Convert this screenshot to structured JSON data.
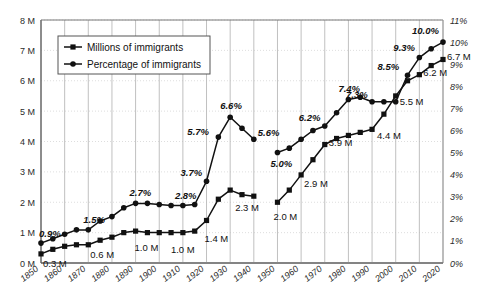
{
  "chart_data": {
    "type": "line",
    "title": "",
    "xlabel": "",
    "ylabel": "",
    "legend_position": "top-left",
    "grid": true,
    "x": [
      1850,
      1855,
      1860,
      1865,
      1870,
      1875,
      1880,
      1885,
      1890,
      1895,
      1900,
      1905,
      1910,
      1915,
      1920,
      1925,
      1930,
      1935,
      1940,
      1945,
      1950,
      1955,
      1960,
      1965,
      1970,
      1975,
      1980,
      1985,
      1990,
      1995,
      2000,
      2005,
      2010,
      2015,
      2020
    ],
    "xticks": [
      "1850",
      "1860",
      "1870",
      "1880",
      "1890",
      "1900",
      "1910",
      "1920",
      "1930",
      "1940",
      "1950",
      "1960",
      "1970",
      "1980",
      "1990",
      "2000",
      "2010",
      "2020"
    ],
    "xlim": [
      1850,
      2020
    ],
    "left_axis": {
      "label": "Millions of immigrants",
      "ticks": [
        "0 M",
        "1 M",
        "2 M",
        "3 M",
        "4 M",
        "5 M",
        "6 M",
        "7 M",
        "8 M"
      ],
      "ylim": [
        0,
        8
      ],
      "unit": "M"
    },
    "right_axis": {
      "label": "Percentage of immigrants",
      "ticks": [
        "0%",
        "1%",
        "2%",
        "3%",
        "4%",
        "5%",
        "6%",
        "7%",
        "8%",
        "9%",
        "10%",
        "11%"
      ],
      "ylim": [
        0,
        11
      ],
      "unit": "%"
    },
    "series": [
      {
        "name": "Millions of immigrants",
        "axis": "left",
        "marker": "square",
        "color": "#111111",
        "values": [
          0.3,
          0.45,
          0.55,
          0.6,
          0.6,
          0.75,
          0.85,
          1.0,
          1.05,
          1.0,
          1.0,
          1.0,
          1.0,
          1.05,
          1.4,
          2.1,
          2.4,
          2.25,
          2.2,
          null,
          2.0,
          2.4,
          2.9,
          3.4,
          3.9,
          4.1,
          4.2,
          4.3,
          4.4,
          4.9,
          5.5,
          6.0,
          6.2,
          6.5,
          6.7
        ],
        "labeled_points": [
          {
            "x": 1850,
            "value": "0.3 M"
          },
          {
            "x": 1870,
            "value": "0.6 M"
          },
          {
            "x": 1890,
            "value": "1.0 M"
          },
          {
            "x": 1910,
            "value": "1.0 M"
          },
          {
            "x": 1920,
            "value": "1.4 M"
          },
          {
            "x": 1930,
            "value": "2.3 M"
          },
          {
            "x": 1950,
            "value": "2.0 M"
          },
          {
            "x": 1960,
            "value": "2.9 M"
          },
          {
            "x": 1970,
            "value": "3.9 M"
          },
          {
            "x": 1990,
            "value": "4.4 M"
          },
          {
            "x": 2000,
            "value": "5.5 M"
          },
          {
            "x": 2010,
            "value": "6.2 M"
          },
          {
            "x": 2020,
            "value": "6.7 M"
          }
        ]
      },
      {
        "name": "Percentage of immigrants",
        "axis": "right",
        "marker": "circle",
        "color": "#111111",
        "values": [
          0.9,
          1.1,
          1.3,
          1.5,
          1.5,
          1.9,
          2.1,
          2.5,
          2.7,
          2.7,
          2.65,
          2.6,
          2.6,
          2.65,
          3.7,
          5.7,
          6.6,
          6.1,
          5.6,
          null,
          5.0,
          5.2,
          5.6,
          6.0,
          6.2,
          6.8,
          7.4,
          7.5,
          7.3,
          7.3,
          7.3,
          8.5,
          9.3,
          9.7,
          10.0
        ],
        "labeled_points": [
          {
            "x": 1850,
            "value": "0.9%"
          },
          {
            "x": 1870,
            "value": "1.5%"
          },
          {
            "x": 1890,
            "value": "2.7%"
          },
          {
            "x": 1910,
            "value": "2.8%"
          },
          {
            "x": 1920,
            "value": "3.7%"
          },
          {
            "x": 1925,
            "value": "5.7%"
          },
          {
            "x": 1930,
            "value": "6.6%"
          },
          {
            "x": 1940,
            "value": "5.6%"
          },
          {
            "x": 1950,
            "value": "5.0%"
          },
          {
            "x": 1970,
            "value": "6.2%"
          },
          {
            "x": 1980,
            "value": "7.4%"
          },
          {
            "x": 1990,
            "value": "7.3%"
          },
          {
            "x": 2005,
            "value": "8.5%"
          },
          {
            "x": 2010,
            "value": "9.3%"
          },
          {
            "x": 2020,
            "value": "10.0%"
          }
        ]
      }
    ]
  },
  "legend": {
    "items": [
      {
        "label": "Millions of immigrants",
        "marker": "square"
      },
      {
        "label": "Percentage of immigrants",
        "marker": "circle"
      }
    ]
  },
  "left_ticks": [
    "8 M",
    "7 M",
    "6 M",
    "5 M",
    "4 M",
    "3 M",
    "2 M",
    "1 M",
    "0 M"
  ],
  "right_ticks": [
    "11%",
    "10%",
    "9%",
    "8%",
    "7%",
    "6%",
    "5%",
    "4%",
    "3%",
    "2%",
    "1%",
    "0%"
  ],
  "xticks": [
    "1850",
    "1860",
    "1870",
    "1880",
    "1890",
    "1900",
    "1910",
    "1920",
    "1930",
    "1940",
    "1950",
    "1960",
    "1970",
    "1980",
    "1990",
    "2000",
    "2010",
    "2020"
  ],
  "colors": {
    "line": "#111111",
    "grid": "#b9b9b9",
    "hgrid": "#d6d6d6",
    "axis": "#6b6b6b",
    "text": "#1a1a1a"
  }
}
